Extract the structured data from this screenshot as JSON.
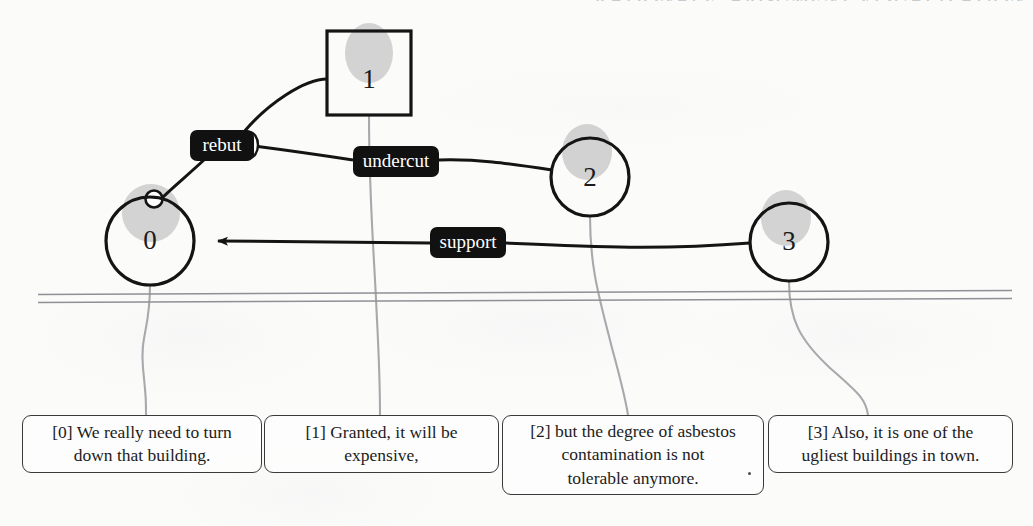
{
  "page": {
    "header_partial_text": "RATIONALE: ARGUMENT VISUALIZATION",
    "background_color": "#fbfbfa",
    "width": 1033,
    "height": 526
  },
  "graph": {
    "nodes": [
      {
        "id": "0",
        "label": "0",
        "shape": "circle",
        "cx": 150,
        "cy": 241,
        "r": 44
      },
      {
        "id": "1",
        "label": "1",
        "shape": "square",
        "x": 327,
        "y": 31,
        "w": 84,
        "h": 84
      },
      {
        "id": "2",
        "label": "2",
        "shape": "circle",
        "cx": 590,
        "cy": 177,
        "r": 39
      },
      {
        "id": "3",
        "label": "3",
        "shape": "circle",
        "cx": 789,
        "cy": 242,
        "r": 39
      }
    ],
    "edge_labels": [
      {
        "id": "rebut",
        "label": "rebut",
        "cx": 222,
        "cy": 145,
        "w": 64,
        "h": 30
      },
      {
        "id": "undercut",
        "label": "undercut",
        "cx": 396,
        "cy": 161,
        "w": 86,
        "h": 30
      },
      {
        "id": "support",
        "label": "support",
        "cx": 468,
        "cy": 242,
        "w": 76,
        "h": 30
      }
    ],
    "edges": [
      {
        "from": "1",
        "to": "0",
        "label": "rebut",
        "arrow": true
      },
      {
        "from": "2",
        "to": "rebut",
        "label": "undercut",
        "arrow": false
      },
      {
        "from": "3",
        "to": "0",
        "label": "support",
        "arrow": true
      }
    ],
    "node_highlight_color": "#cfcfcf",
    "node_stroke_color": "#1b1b1b",
    "edge_label_fill": "#111111",
    "edge_label_text_color": "#ffffff"
  },
  "separator": {
    "name": "double-rule",
    "color": "#9a9aa0"
  },
  "propositions": [
    {
      "id": "0",
      "lines": [
        "[0] We really need to turn",
        "down that building."
      ],
      "x": 22,
      "y": 415,
      "w": 240,
      "h": 58
    },
    {
      "id": "1",
      "lines": [
        "[1] Granted, it will be",
        "expensive,"
      ],
      "x": 264,
      "y": 415,
      "w": 235,
      "h": 58
    },
    {
      "id": "2",
      "lines": [
        "[2] but the degree of asbestos",
        "contamination is not",
        "tolerable anymore."
      ],
      "x": 502,
      "y": 415,
      "w": 262,
      "h": 80
    },
    {
      "id": "3",
      "lines": [
        "[3] Also, it is one of the",
        "ugliest buildings in town."
      ],
      "x": 768,
      "y": 415,
      "w": 245,
      "h": 58
    }
  ],
  "connectors": {
    "color": "#a7a7ab",
    "description": "thin grey curves linking each graph node to its proposition box"
  }
}
